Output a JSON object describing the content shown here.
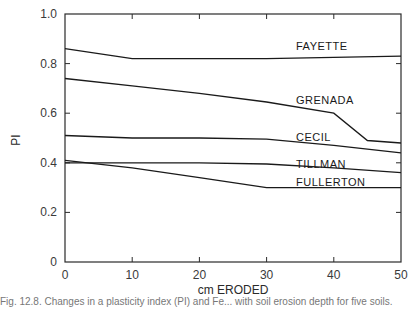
{
  "chart_data": {
    "type": "line",
    "title": "",
    "xlabel": "cm ERODED",
    "ylabel": "PI",
    "xlim": [
      0,
      50
    ],
    "ylim": [
      0,
      1.0
    ],
    "x_ticks": [
      0,
      10,
      20,
      30,
      40,
      50
    ],
    "x_tick_labels": [
      "0",
      "10",
      "20",
      "30",
      "40",
      "50"
    ],
    "y_ticks": [
      0,
      0.2,
      0.4,
      0.6,
      0.8,
      1.0
    ],
    "y_tick_labels": [
      "0",
      "0.2",
      "0.4",
      "0.6",
      "0.8",
      "1.0"
    ],
    "grid": false,
    "legend": "inline labels near right end of each curve",
    "series": [
      {
        "name": "FAYETTE",
        "x": [
          0,
          10,
          20,
          30,
          40,
          50
        ],
        "values": [
          0.86,
          0.82,
          0.82,
          0.82,
          0.825,
          0.83
        ]
      },
      {
        "name": "GRENADA",
        "x": [
          0,
          10,
          20,
          30,
          40,
          45,
          50
        ],
        "values": [
          0.74,
          0.71,
          0.68,
          0.645,
          0.6,
          0.49,
          0.48
        ]
      },
      {
        "name": "CECIL",
        "x": [
          0,
          10,
          20,
          30,
          40,
          50
        ],
        "values": [
          0.51,
          0.5,
          0.5,
          0.495,
          0.47,
          0.44
        ]
      },
      {
        "name": "TILLMAN",
        "x": [
          0,
          10,
          20,
          30,
          40,
          50
        ],
        "values": [
          0.4,
          0.4,
          0.4,
          0.395,
          0.38,
          0.36
        ]
      },
      {
        "name": "FULLERTON",
        "x": [
          0,
          10,
          20,
          30,
          40,
          50
        ],
        "values": [
          0.41,
          0.38,
          0.34,
          0.3,
          0.3,
          0.3
        ]
      }
    ]
  },
  "caption": "Fig. 12.8. Changes in a plasticity index (PI) and Fe... with soil erosion depth for five soils."
}
